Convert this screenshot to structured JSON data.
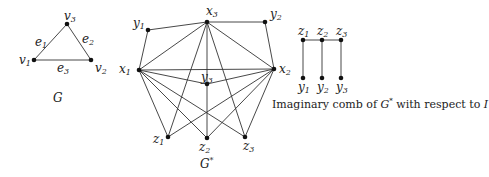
{
  "graphs": {
    "G": {
      "caption": "G",
      "nodes": [
        {
          "id": "v1",
          "base": "v",
          "sub": "1",
          "x": 34,
          "y": 60
        },
        {
          "id": "v2",
          "base": "v",
          "sub": "2",
          "x": 91,
          "y": 60
        },
        {
          "id": "v3",
          "base": "v",
          "sub": "3",
          "x": 67,
          "y": 24
        }
      ],
      "edges": [
        {
          "label_base": "e",
          "label_sub": "1",
          "from": "v1",
          "to": "v3"
        },
        {
          "label_base": "e",
          "label_sub": "2",
          "from": "v3",
          "to": "v2"
        },
        {
          "label_base": "e",
          "label_sub": "3",
          "from": "v1",
          "to": "v2"
        }
      ]
    },
    "G_star": {
      "caption": "G",
      "caption_sup": "*",
      "nodes": [
        {
          "id": "x1",
          "base": "x",
          "sub": "1",
          "x": 139,
          "y": 70
        },
        {
          "id": "x2",
          "base": "x",
          "sub": "2",
          "x": 274,
          "y": 69
        },
        {
          "id": "x3",
          "base": "x",
          "sub": "3",
          "x": 207,
          "y": 22
        },
        {
          "id": "y1",
          "base": "y",
          "sub": "1",
          "x": 148,
          "y": 30
        },
        {
          "id": "y2",
          "base": "y",
          "sub": "2",
          "x": 265,
          "y": 22
        },
        {
          "id": "y3",
          "base": "y",
          "sub": "3",
          "x": 207,
          "y": 84
        },
        {
          "id": "z1",
          "base": "z",
          "sub": "1",
          "x": 168,
          "y": 137
        },
        {
          "id": "z2",
          "base": "z",
          "sub": "2",
          "x": 207,
          "y": 138
        },
        {
          "id": "z3",
          "base": "z",
          "sub": "3",
          "x": 245,
          "y": 137
        }
      ],
      "edges": [
        [
          "x1",
          "y1"
        ],
        [
          "y1",
          "x3"
        ],
        [
          "x3",
          "y2"
        ],
        [
          "y2",
          "x2"
        ],
        [
          "x1",
          "x3"
        ],
        [
          "x3",
          "x2"
        ],
        [
          "x1",
          "x2"
        ],
        [
          "x1",
          "y3"
        ],
        [
          "y3",
          "x2"
        ],
        [
          "x1",
          "z1"
        ],
        [
          "x1",
          "z2"
        ],
        [
          "x1",
          "z3"
        ],
        [
          "x2",
          "z1"
        ],
        [
          "x2",
          "z2"
        ],
        [
          "x2",
          "z3"
        ],
        [
          "x3",
          "z1"
        ],
        [
          "x3",
          "z2"
        ],
        [
          "x3",
          "z3"
        ]
      ]
    },
    "comb": {
      "caption_prefix": "Imaginary comb of ",
      "caption_graph": "G",
      "caption_sup": "*",
      "caption_mid": " with respect to ",
      "caption_set": "I",
      "nodes": [
        {
          "id": "cz1",
          "base": "z",
          "sub": "1",
          "x": 303,
          "y": 40
        },
        {
          "id": "cz2",
          "base": "z",
          "sub": "2",
          "x": 322,
          "y": 40
        },
        {
          "id": "cz3",
          "base": "z",
          "sub": "3",
          "x": 341,
          "y": 40
        },
        {
          "id": "cy1",
          "base": "y",
          "sub": "1",
          "x": 303,
          "y": 78
        },
        {
          "id": "cy2",
          "base": "y",
          "sub": "2",
          "x": 322,
          "y": 78
        },
        {
          "id": "cy3",
          "base": "y",
          "sub": "3",
          "x": 341,
          "y": 78
        }
      ],
      "edges": [
        [
          "cz1",
          "cz2"
        ],
        [
          "cz2",
          "cz3"
        ],
        [
          "cz1",
          "cy1"
        ],
        [
          "cz2",
          "cy2"
        ],
        [
          "cz3",
          "cy3"
        ]
      ]
    }
  }
}
